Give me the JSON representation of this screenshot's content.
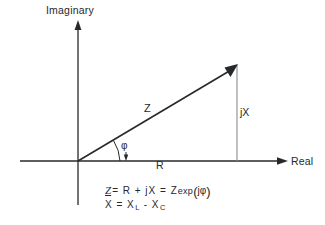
{
  "figure": {
    "background_color": "#ffffff",
    "line_color": "#26282b",
    "dropline_color": "#8a8d91",
    "axes": {
      "vertical_label": "Imaginary",
      "horizontal_label": "Real",
      "origin": {
        "x": 78,
        "y": 161
      },
      "vertical_arrow_tip": {
        "x": 78,
        "y": 22
      },
      "horizontal_arrow_tip": {
        "x": 285,
        "y": 161
      },
      "horizontal_left_end": {
        "x": 20,
        "y": 161
      },
      "vertical_bottom_end": {
        "x": 78,
        "y": 205
      }
    },
    "vector": {
      "label": "Z",
      "tip": {
        "x": 237,
        "y": 65
      },
      "real_component_label": "R",
      "imaginary_component_label": "jX",
      "angle_label": "φ"
    },
    "equations": {
      "line1": {
        "symbol": "Z",
        "eq1": "= R + jX = Z",
        "exp": "exp",
        "open_paren": "(",
        "arg": "jφ",
        "close_paren": ")"
      },
      "line2": {
        "lhs": "X =  X",
        "sub_l": "L",
        "minus": " -  X",
        "sub_c": "C"
      }
    }
  }
}
